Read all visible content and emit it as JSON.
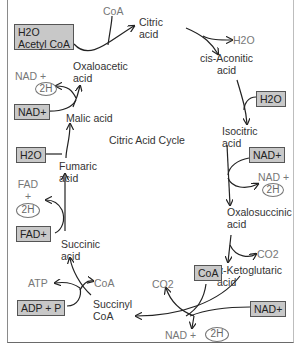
{
  "diagram": {
    "title": "Citric Acid Cycle",
    "intermediates": {
      "citric_acid": [
        "Citric",
        "acid"
      ],
      "cis_aconitic_acid": [
        "cis-Aconitic",
        "acid"
      ],
      "isocitric_acid": [
        "Isocitric",
        "acid"
      ],
      "oxalosuccinic_acid": [
        "Oxalosuccinic",
        "acid"
      ],
      "alpha_ketoglutaric_acid": [
        "α-Ketoglutaric",
        "acid"
      ],
      "succinyl_coa": [
        "Succinyl",
        "CoA"
      ],
      "succinic_acid": [
        "Succinic",
        "acid"
      ],
      "fumaric_acid": [
        "Fumaric",
        "acid"
      ],
      "malic_acid": "Malic acid",
      "oxaloacetic_acid": [
        "Oxaloacetic",
        "acid"
      ]
    },
    "inputs": {
      "h2o_acetyl_coa": [
        "H2O",
        "Acetyl CoA"
      ],
      "h2o_aconitic": "H2O",
      "nad_isocitric": "NAD+",
      "coa_ketoglutaric": "CoA",
      "nad_ketoglutaric": "NAD+",
      "adp_p": "ADP + P",
      "fad": "FAD+",
      "h2o_fumaric": "H2O",
      "nad_malic": "NAD+"
    },
    "outputs": {
      "coa_citric": "CoA",
      "h2o_citric": "H2O",
      "nad_2h_isocitric": [
        "NAD +",
        "2H"
      ],
      "co2_oxalosuccinic": "CO2",
      "co2_ketoglutaric": "CO2",
      "nad_2h_ketoglutaric": [
        "NAD +",
        "2H"
      ],
      "atp": "ATP",
      "coa_succinyl": "CoA",
      "fad_2h": [
        "FAD",
        "+",
        "2H"
      ],
      "nad_2h_malic": [
        "NAD +",
        "2H"
      ]
    },
    "colors": {
      "box_fill": "#c8c8c8",
      "box_border": "#555555",
      "arrow": "#222222",
      "product_text": "#777777"
    }
  }
}
